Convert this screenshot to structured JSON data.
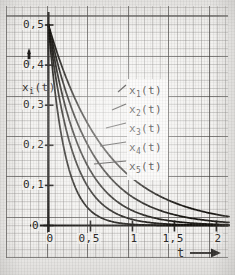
{
  "chart_data": {
    "type": "line",
    "title": "",
    "xlabel": "t",
    "ylabel": "x_i(t)",
    "xlim": [
      0,
      2.15
    ],
    "ylim": [
      0,
      0.52
    ],
    "grid": true,
    "grid_style": "graph-paper",
    "legend_position": "inside-right",
    "x_ticks": [
      "0",
      "0,5",
      "1",
      "1,5",
      "2"
    ],
    "x_tick_values": [
      0,
      0.5,
      1,
      1.5,
      2
    ],
    "y_ticks": [
      "0",
      "0,1",
      "0,2",
      "0,3",
      "0,4",
      "0,5"
    ],
    "y_tick_values": [
      0,
      0.1,
      0.2,
      0.3,
      0.4,
      0.5
    ],
    "x_axis_arrow": "→",
    "y_axis_arrow": "↑",
    "initial_value": 0.5,
    "series": [
      {
        "name": "x1(t)",
        "label": "x",
        "sub": "1",
        "suffix": "(t)",
        "decay": 1.45,
        "x": [
          0,
          0.1,
          0.2,
          0.3,
          0.4,
          0.5,
          0.6,
          0.7,
          0.8,
          0.9,
          1.0,
          1.2,
          1.4,
          1.6,
          1.8,
          2.0,
          2.15
        ],
        "values": [
          0.5,
          0.432,
          0.374,
          0.323,
          0.28,
          0.242,
          0.209,
          0.181,
          0.157,
          0.135,
          0.117,
          0.088,
          0.066,
          0.049,
          0.037,
          0.027,
          0.022
        ]
      },
      {
        "name": "x2(t)",
        "label": "x",
        "sub": "2",
        "suffix": "(t)",
        "decay": 1.95,
        "x": [
          0,
          0.1,
          0.2,
          0.3,
          0.4,
          0.5,
          0.6,
          0.7,
          0.8,
          0.9,
          1.0,
          1.2,
          1.4,
          1.6,
          1.8,
          2.0,
          2.15
        ],
        "values": [
          0.5,
          0.411,
          0.338,
          0.278,
          0.229,
          0.188,
          0.155,
          0.127,
          0.105,
          0.086,
          0.071,
          0.048,
          0.032,
          0.022,
          0.015,
          0.01,
          0.008
        ]
      },
      {
        "name": "x3(t)",
        "label": "x",
        "sub": "3",
        "suffix": "(t)",
        "decay": 2.6,
        "x": [
          0,
          0.1,
          0.2,
          0.3,
          0.4,
          0.5,
          0.6,
          0.7,
          0.8,
          0.9,
          1.0,
          1.2,
          1.4,
          1.6,
          1.8,
          2.0,
          2.15
        ],
        "values": [
          0.5,
          0.385,
          0.297,
          0.229,
          0.177,
          0.136,
          0.105,
          0.081,
          0.062,
          0.048,
          0.037,
          0.022,
          0.013,
          0.008,
          0.005,
          0.003,
          0.002
        ]
      },
      {
        "name": "x4(t)",
        "label": "x",
        "sub": "4",
        "suffix": "(t)",
        "decay": 3.5,
        "x": [
          0,
          0.1,
          0.2,
          0.3,
          0.4,
          0.5,
          0.6,
          0.7,
          0.8,
          0.9,
          1.0,
          1.2,
          1.4,
          1.6,
          1.8,
          2.0,
          2.15
        ],
        "values": [
          0.5,
          0.352,
          0.248,
          0.175,
          0.123,
          0.087,
          0.061,
          0.043,
          0.03,
          0.021,
          0.015,
          0.008,
          0.004,
          0.002,
          0.001,
          0.0,
          0.0
        ]
      },
      {
        "name": "x5(t)",
        "label": "x",
        "sub": "5",
        "suffix": "(t)",
        "decay": 5.2,
        "x": [
          0,
          0.1,
          0.2,
          0.3,
          0.4,
          0.5,
          0.6,
          0.7,
          0.8,
          0.9,
          1.0,
          1.2,
          1.4,
          1.6,
          1.8,
          2.0,
          2.15
        ],
        "values": [
          0.5,
          0.297,
          0.177,
          0.105,
          0.062,
          0.037,
          0.022,
          0.013,
          0.008,
          0.005,
          0.003,
          0.001,
          0.0,
          0.0,
          0.0,
          0.0,
          0.0
        ]
      }
    ]
  },
  "axis": {
    "y_label_text": "x",
    "y_label_sub": "i",
    "y_label_suffix": "(t)",
    "x_label_text": "t",
    "x_label_arrow": "▶"
  },
  "y_tick_labels": [
    "0,5",
    "0,4",
    "0,3",
    "0,2",
    "0,1",
    "0"
  ],
  "x_tick_labels": [
    "0",
    "0,5",
    "1",
    "1,5",
    "2"
  ],
  "legend": {
    "entries": [
      {
        "label": "x",
        "sub": "1",
        "suffix": "(t)"
      },
      {
        "label": "x",
        "sub": "2",
        "suffix": "(t)"
      },
      {
        "label": "x",
        "sub": "3",
        "suffix": "(t)"
      },
      {
        "label": "x",
        "sub": "4",
        "suffix": "(t)"
      },
      {
        "label": "x",
        "sub": "5",
        "suffix": "(t)"
      }
    ]
  },
  "colors": {
    "ink": "#1d1b19",
    "paper": "#f3f2f0",
    "grid_major": "#3c3a38",
    "grid_minor": "#5f5c5a"
  }
}
